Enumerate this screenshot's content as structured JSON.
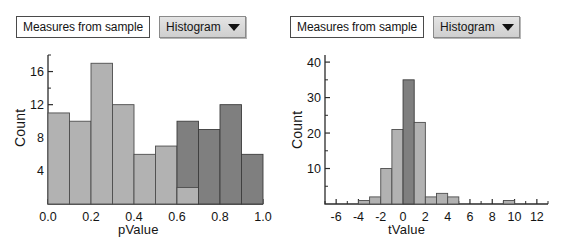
{
  "panels": [
    {
      "id": "left",
      "measure_label": "Measures from sample",
      "chart_type_label": "Histogram",
      "caret_icon": "chevron-down-icon"
    },
    {
      "id": "right",
      "measure_label": "Measures from sample",
      "chart_type_label": "Histogram",
      "caret_icon": "chevron-down-icon"
    }
  ],
  "chart_data": [
    {
      "type": "bar",
      "title": "",
      "xlabel": "pValue",
      "ylabel": "Count",
      "xlim": [
        0.0,
        1.0
      ],
      "ylim": [
        0,
        18
      ],
      "xticks": [
        "0.0",
        "0.2",
        "0.4",
        "0.6",
        "0.8",
        "1.0"
      ],
      "xtick_values": [
        0.0,
        0.2,
        0.4,
        0.6,
        0.8,
        1.0
      ],
      "yticks": [
        "4",
        "8",
        "12",
        "16"
      ],
      "ytick_values": [
        4,
        8,
        12,
        16
      ],
      "grid": false,
      "legend": "none",
      "bin_width": 0.1,
      "categories": [
        "0.0-0.1",
        "0.1-0.2",
        "0.2-0.3",
        "0.3-0.4",
        "0.4-0.5",
        "0.5-0.6",
        "0.6-0.7",
        "0.7-0.8",
        "0.8-0.9",
        "0.9-1.0"
      ],
      "values": [
        11,
        10,
        17,
        12,
        6,
        7,
        10,
        9,
        12,
        6
      ],
      "bar_colors": [
        "light",
        "light",
        "light",
        "light",
        "light",
        "light",
        "dark",
        "dark",
        "dark",
        "dark"
      ],
      "overlay": {
        "bin": "0.6-0.7",
        "light_base_value": 2
      },
      "colors": {
        "light": "#b2b2b2",
        "dark": "#7f7f7f",
        "outline": "#4d4d4d"
      }
    },
    {
      "type": "bar",
      "title": "",
      "xlabel": "tValue",
      "ylabel": "Count",
      "xlim": [
        -7,
        13
      ],
      "ylim": [
        0,
        42
      ],
      "xticks": [
        "-6",
        "-4",
        "-2",
        "0",
        "2",
        "4",
        "6",
        "8",
        "10",
        "12"
      ],
      "xtick_values": [
        -6,
        -4,
        -2,
        0,
        2,
        4,
        6,
        8,
        10,
        12
      ],
      "yticks": [
        "10",
        "20",
        "30",
        "40"
      ],
      "ytick_values": [
        10,
        20,
        30,
        40
      ],
      "grid": false,
      "legend": "none",
      "bin_width": 1,
      "categories": [
        "-4",
        "-3",
        "-2",
        "-1",
        "0",
        "1",
        "2",
        "3",
        "9"
      ],
      "bin_starts": [
        -4,
        -3,
        -2,
        -1,
        0,
        1,
        2,
        3,
        9
      ],
      "values": [
        1,
        2,
        10,
        21,
        35,
        23,
        2,
        3,
        1
      ],
      "extra_bins": [
        {
          "start": 4,
          "value": 2
        }
      ],
      "bar_colors": [
        "light",
        "light",
        "light",
        "light",
        "dark",
        "light",
        "light",
        "light",
        "light"
      ],
      "colors": {
        "light": "#b2b2b2",
        "dark": "#7f7f7f",
        "outline": "#4d4d4d"
      }
    }
  ]
}
